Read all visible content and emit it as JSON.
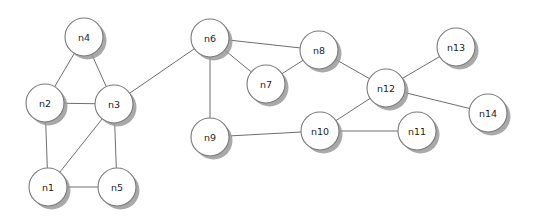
{
  "diagram": {
    "background_color": "#ffffff",
    "node_fill_color": "#ffffff",
    "node_border_color": "#7a7a7a",
    "node_shadow_color": "#9a9a9a",
    "edge_color": "#6e6e6e",
    "label_color": "#1c1c1c",
    "node_radius": 19,
    "node_count": 14,
    "edge_count": 20
  },
  "chart_data": {
    "type": "diagram",
    "nodes": [
      {
        "id": "n1",
        "label": "n1",
        "x": 48,
        "y": 187,
        "r": 19,
        "degree": 3
      },
      {
        "id": "n2",
        "label": "n2",
        "x": 45,
        "y": 103,
        "r": 19,
        "degree": 3
      },
      {
        "id": "n3",
        "label": "n3",
        "x": 114,
        "y": 104,
        "r": 19,
        "degree": 5
      },
      {
        "id": "n4",
        "label": "n4",
        "x": 84,
        "y": 37,
        "r": 19,
        "degree": 2
      },
      {
        "id": "n5",
        "label": "n5",
        "x": 117,
        "y": 187,
        "r": 19,
        "degree": 2
      },
      {
        "id": "n6",
        "label": "n6",
        "x": 210,
        "y": 38,
        "r": 19,
        "degree": 4
      },
      {
        "id": "n7",
        "label": "n7",
        "x": 266,
        "y": 84,
        "r": 19,
        "degree": 2
      },
      {
        "id": "n8",
        "label": "n8",
        "x": 319,
        "y": 50,
        "r": 19,
        "degree": 3
      },
      {
        "id": "n9",
        "label": "n9",
        "x": 210,
        "y": 137,
        "r": 19,
        "degree": 2
      },
      {
        "id": "n10",
        "label": "n10",
        "x": 320,
        "y": 131,
        "r": 19,
        "degree": 3
      },
      {
        "id": "n11",
        "label": "n11",
        "x": 417,
        "y": 131,
        "r": 19,
        "degree": 1
      },
      {
        "id": "n12",
        "label": "n12",
        "x": 386,
        "y": 88,
        "r": 19,
        "degree": 4
      },
      {
        "id": "n13",
        "label": "n13",
        "x": 456,
        "y": 47,
        "r": 19,
        "degree": 1
      },
      {
        "id": "n14",
        "label": "n14",
        "x": 488,
        "y": 113,
        "r": 19,
        "degree": 1
      }
    ],
    "edges": [
      {
        "source": "n1",
        "target": "n2"
      },
      {
        "source": "n1",
        "target": "n3"
      },
      {
        "source": "n1",
        "target": "n5"
      },
      {
        "source": "n2",
        "target": "n3"
      },
      {
        "source": "n2",
        "target": "n4"
      },
      {
        "source": "n3",
        "target": "n4"
      },
      {
        "source": "n3",
        "target": "n5"
      },
      {
        "source": "n3",
        "target": "n6"
      },
      {
        "source": "n6",
        "target": "n7"
      },
      {
        "source": "n6",
        "target": "n8"
      },
      {
        "source": "n6",
        "target": "n9"
      },
      {
        "source": "n7",
        "target": "n8"
      },
      {
        "source": "n8",
        "target": "n12"
      },
      {
        "source": "n9",
        "target": "n10"
      },
      {
        "source": "n10",
        "target": "n11"
      },
      {
        "source": "n10",
        "target": "n12"
      },
      {
        "source": "n12",
        "target": "n13"
      },
      {
        "source": "n12",
        "target": "n14"
      }
    ],
    "directed": false,
    "layout": "manual-positions",
    "xlim": [
      0,
      536
    ],
    "ylim": [
      0,
      220
    ]
  }
}
